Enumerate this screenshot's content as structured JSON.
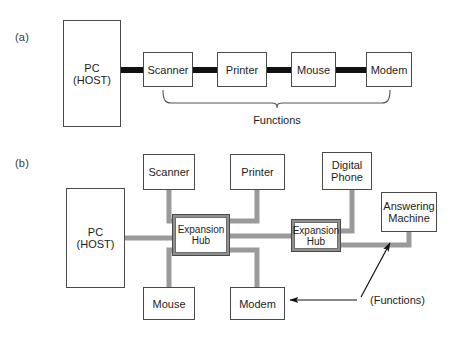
{
  "figure": {
    "type": "usb-topology-diagram",
    "panels": [
      {
        "id": "a",
        "label": "(a)",
        "label_pos": {
          "x": 15,
          "y": 31
        },
        "topology": "daisy-chain",
        "host": {
          "name": "pc-host",
          "text": "PC\n(HOST)",
          "x": 63,
          "y": 20,
          "w": 58,
          "h": 107
        },
        "nodes": [
          {
            "name": "scanner",
            "text": "Scanner",
            "x": 143,
            "y": 52,
            "w": 50,
            "h": 35
          },
          {
            "name": "printer",
            "text": "Printer",
            "x": 217,
            "y": 52,
            "w": 50,
            "h": 35
          },
          {
            "name": "mouse",
            "text": "Mouse",
            "x": 291,
            "y": 52,
            "w": 45,
            "h": 35
          },
          {
            "name": "modem",
            "text": "Modem",
            "x": 366,
            "y": 52,
            "w": 46,
            "h": 35
          }
        ],
        "links": [
          {
            "from": "pc-host",
            "to": "scanner",
            "x1": 121,
            "x2": 143,
            "y": 70
          },
          {
            "from": "scanner",
            "to": "printer",
            "x1": 193,
            "x2": 217,
            "y": 70
          },
          {
            "from": "printer",
            "to": "mouse",
            "x1": 267,
            "x2": 291,
            "y": 70
          },
          {
            "from": "mouse",
            "to": "modem",
            "x1": 336,
            "x2": 366,
            "y": 70
          }
        ],
        "brace": {
          "name": "functions-brace",
          "left": 163,
          "right": 390,
          "top": 90,
          "bottom": 106,
          "tip_x": 277
        },
        "brace_label": {
          "text": "Functions",
          "x": 277,
          "y": 121
        }
      },
      {
        "id": "b",
        "label": "(b)",
        "label_pos": {
          "x": 15,
          "y": 157
        },
        "topology": "tiered-star-with-hubs",
        "host": {
          "name": "pc-host",
          "text": "PC\n(HOST)",
          "x": 66,
          "y": 188,
          "w": 59,
          "h": 100
        },
        "nodes": [
          {
            "name": "scanner",
            "text": "Scanner",
            "x": 143,
            "y": 154,
            "w": 52,
            "h": 36
          },
          {
            "name": "printer",
            "text": "Printer",
            "x": 230,
            "y": 154,
            "w": 55,
            "h": 36
          },
          {
            "name": "digital-phone",
            "text": "Digital\nPhone",
            "x": 322,
            "y": 152,
            "w": 50,
            "h": 38
          },
          {
            "name": "answering-machine",
            "text": "Answering\nMachine",
            "x": 381,
            "y": 192,
            "w": 56,
            "h": 40
          },
          {
            "name": "mouse",
            "text": "Mouse",
            "x": 143,
            "y": 287,
            "w": 52,
            "h": 33
          },
          {
            "name": "modem",
            "text": "Modem",
            "x": 230,
            "y": 287,
            "w": 55,
            "h": 33
          }
        ],
        "hubs": [
          {
            "name": "expansion-hub-1",
            "text": "Expansion\nHub",
            "x": 172,
            "y": 214,
            "w": 58,
            "h": 42
          },
          {
            "name": "expansion-hub-2",
            "text": "Expansion\nHub",
            "x": 291,
            "y": 219,
            "w": 50,
            "h": 33
          }
        ],
        "annotation": {
          "text": "(Functions)",
          "x": 370,
          "y": 300,
          "arrow_to_modem": {
            "x1": 358,
            "y1": 300,
            "x2": 289,
            "y2": 300
          },
          "arrow_to_hub_link": {
            "x1": 362,
            "y1": 296,
            "x2": 391,
            "y2": 242
          }
        }
      }
    ],
    "colors": {
      "background": "#ffffff",
      "box_border": "#4a4a4a",
      "text": "#1d1d1d",
      "panel_label": "#3a3a3a",
      "link_panel_a": "#111111",
      "link_panel_b": "#9a9a9a",
      "hub_border": "#8f8f8f",
      "brace": "#555555",
      "arrow": "#111111"
    }
  }
}
